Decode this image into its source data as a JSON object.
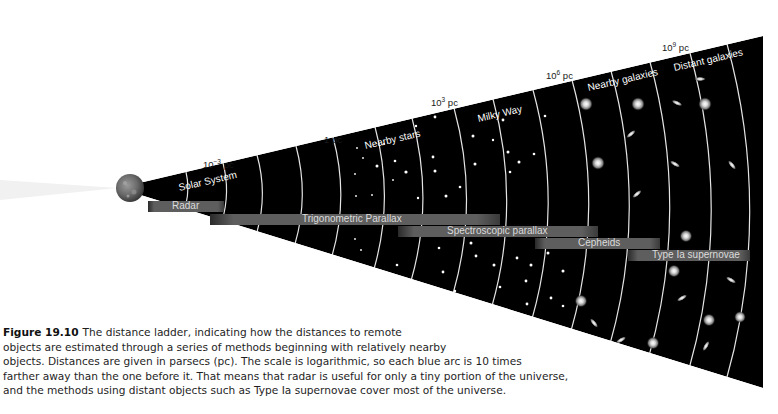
{
  "background_ghost_text": {
    "top_right_paragraph": [
      "…correlation between luminosity and period…",
      "…which are large and white…",
      "…galaxies, where the …",
      "…",
      "…"
    ],
    "left_figure_caption_ghost": [
      "Figure 19.9",
      "",
      "",
      ""
    ]
  },
  "diagram": {
    "distance_markers": [
      {
        "base": "10",
        "exp": "−3",
        "unit": "pc"
      },
      {
        "base": "1",
        "exp": "",
        "unit": "pc"
      },
      {
        "base": "10",
        "exp": "3",
        "unit": "pc"
      },
      {
        "base": "10",
        "exp": "6",
        "unit": "pc"
      },
      {
        "base": "10",
        "exp": "9",
        "unit": "pc"
      }
    ],
    "regions": [
      "Solar System",
      "Nearby stars",
      "Milky Way",
      "Nearby galaxies",
      "Distant galaxies"
    ],
    "methods": [
      {
        "label": "Radar"
      },
      {
        "label": "Trigonometric Parallax"
      },
      {
        "label": "Spectroscopic parallax"
      },
      {
        "label": "Cepheids"
      },
      {
        "label": "Type Ia supernovae"
      }
    ],
    "colors": {
      "wedge": "#000000",
      "arc": "#e6e6e6",
      "method_bar": "#5c5c5c",
      "bar_text": "#dcdcdc",
      "label_text": "#ffffff",
      "marker_text": "#1a1a1a"
    }
  },
  "caption": {
    "figure_label": "Figure 19.10",
    "lines": [
      "The distance ladder, indicating how the distances to remote",
      "objects are estimated through a series of methods beginning with relatively nearby",
      "objects. Distances are given in parsecs (pc). The scale is logarithmic, so each blue arc is 10 times",
      "farther away than the one before it. That means that radar is useful for only a tiny portion of the universe,",
      "and the methods using distant objects such as Type Ia supernovae cover most of the universe."
    ]
  }
}
